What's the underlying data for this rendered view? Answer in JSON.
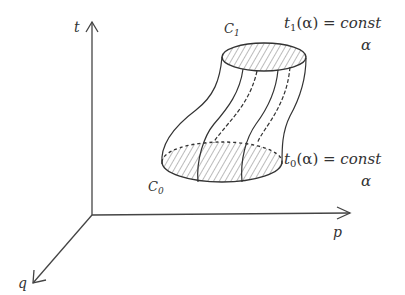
{
  "diagram": {
    "type": "phase-space tube sketch",
    "axes": {
      "t": {
        "label": "t"
      },
      "p": {
        "label": "p"
      },
      "q": {
        "label": "q"
      }
    },
    "curves": {
      "top": {
        "label": "C",
        "subscript": "1"
      },
      "bottom": {
        "label": "C",
        "subscript": "0"
      }
    },
    "conditions": {
      "top": {
        "lhs": "t",
        "lhs_sub": "1",
        "arg": "(α)",
        "eq": " = ",
        "rhs": "const",
        "under": "α"
      },
      "bottom": {
        "lhs": "t",
        "lhs_sub": "0",
        "arg": "(α)",
        "eq": " = ",
        "rhs": "const",
        "under": "α"
      }
    },
    "colors": {
      "stroke": "#333333",
      "background": "#ffffff"
    }
  }
}
